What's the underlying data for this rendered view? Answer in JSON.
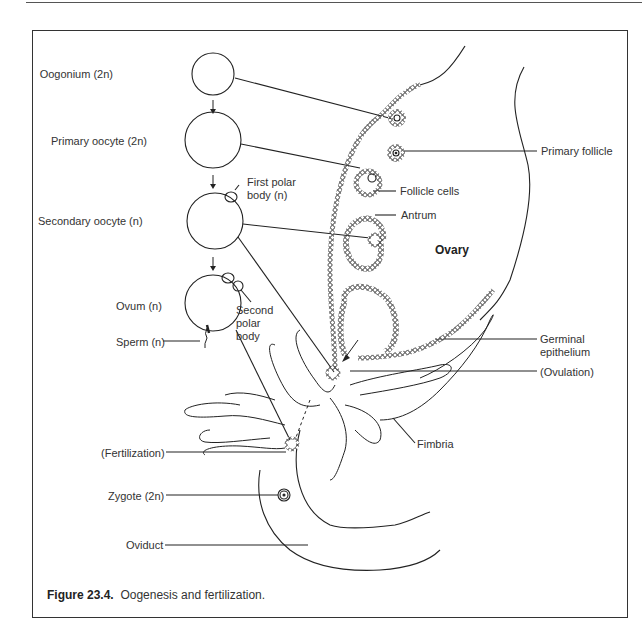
{
  "figure": {
    "caption_number": "Figure 23.4.",
    "caption_text": "Oogenesis and fertilization."
  },
  "stages": [
    {
      "label": "Oogonium (2n)"
    },
    {
      "label": "Primary oocyte (2n)"
    },
    {
      "label": "Secondary oocyte (n)"
    },
    {
      "label": "Ovum (n)"
    }
  ],
  "left_labels": {
    "sperm": "Sperm (n)",
    "fertilization": "(Fertilization)",
    "zygote": "Zygote (2n)",
    "oviduct": "Oviduct"
  },
  "polar_bodies": {
    "first_line1": "First polar",
    "first_line2": "body (n)",
    "second_line1": "Second",
    "second_line2": "polar",
    "second_line3": "body"
  },
  "right_labels": {
    "primary_follicle": "Primary follicle",
    "follicle_cells": "Follicle cells",
    "antrum": "Antrum",
    "ovary": "Ovary",
    "germinal_line1": "Germinal",
    "germinal_line2": "epithelium",
    "ovulation": "(Ovulation)",
    "fimbria": "Fimbria"
  },
  "colors": {
    "line": "#222222",
    "text": "#333333",
    "background": "#ffffff"
  }
}
